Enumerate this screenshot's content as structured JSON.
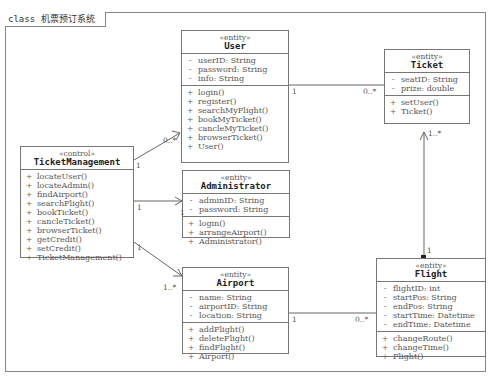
{
  "frame": {
    "label": "class 机票预订系统"
  },
  "classes": {
    "user": {
      "stereotype": "«entity»",
      "name": "User",
      "attributes": [
        {
          "vis": "-",
          "text": "userID: String"
        },
        {
          "vis": "-",
          "text": "password: String"
        },
        {
          "vis": "-",
          "text": "info: String"
        }
      ],
      "operations": [
        {
          "vis": "+",
          "text": "login()"
        },
        {
          "vis": "+",
          "text": "register()"
        },
        {
          "vis": "+",
          "text": "searchMyFlight()"
        },
        {
          "vis": "+",
          "text": "bookMyTicket()"
        },
        {
          "vis": "+",
          "text": "cancleMyTicket()"
        },
        {
          "vis": "+",
          "text": "browserTicket()"
        },
        {
          "vis": "+",
          "text": "User()"
        }
      ]
    },
    "ticket": {
      "stereotype": "«entity»",
      "name": "Ticket",
      "attributes": [
        {
          "vis": "-",
          "text": "seatID: String"
        },
        {
          "vis": "-",
          "text": "prize: double"
        }
      ],
      "operations": [
        {
          "vis": "+",
          "text": "setUser()"
        },
        {
          "vis": "+",
          "text": "Ticket()"
        }
      ]
    },
    "ticketmanagement": {
      "stereotype": "«control»",
      "name": "TicketManagement",
      "attributes": [],
      "operations": [
        {
          "vis": "+",
          "text": "locateUser()"
        },
        {
          "vis": "+",
          "text": "locateAdmin()"
        },
        {
          "vis": "+",
          "text": "findAirport()"
        },
        {
          "vis": "+",
          "text": "searchFlight()"
        },
        {
          "vis": "+",
          "text": "bookTicket()"
        },
        {
          "vis": "+",
          "text": "cancleTicket()"
        },
        {
          "vis": "+",
          "text": "browserTicket()"
        },
        {
          "vis": "+",
          "text": "getCredit()"
        },
        {
          "vis": "+",
          "text": "setCredit()"
        },
        {
          "vis": "+",
          "text": "TicketManagement()"
        }
      ]
    },
    "administrator": {
      "stereotype": "«entity»",
      "name": "Administrator",
      "attributes": [
        {
          "vis": "-",
          "text": "adminID: String"
        },
        {
          "vis": "-",
          "text": "password: String"
        }
      ],
      "operations": [
        {
          "vis": "+",
          "text": "login()"
        },
        {
          "vis": "+",
          "text": "arrangeAirport()"
        },
        {
          "vis": "+",
          "text": "Administrator()"
        }
      ]
    },
    "airport": {
      "stereotype": "«entity»",
      "name": "Airport",
      "attributes": [
        {
          "vis": "-",
          "text": "name: String"
        },
        {
          "vis": "-",
          "text": "airportID: String"
        },
        {
          "vis": "-",
          "text": "location: String"
        }
      ],
      "operations": [
        {
          "vis": "+",
          "text": "addFlight()"
        },
        {
          "vis": "+",
          "text": "deleteFlight()"
        },
        {
          "vis": "+",
          "text": "findFlight()"
        },
        {
          "vis": "+",
          "text": "Airport()"
        }
      ]
    },
    "flight": {
      "stereotype": "«entity»",
      "name": "Flight",
      "attributes": [
        {
          "vis": "-",
          "text": "flightID: int"
        },
        {
          "vis": "-",
          "text": "startPos: String"
        },
        {
          "vis": "-",
          "text": "endPos: String"
        },
        {
          "vis": "-",
          "text": "startTime: Datetime"
        },
        {
          "vis": "-",
          "text": "endTime: Datetime"
        }
      ],
      "operations": [
        {
          "vis": "+",
          "text": "changeRoute()"
        },
        {
          "vis": "+",
          "text": "changeTime()"
        },
        {
          "vis": "+",
          "text": "Flight()"
        }
      ]
    }
  },
  "multiplicities": {
    "tm_user_src": "1",
    "tm_user_dst": "0..*",
    "user_ticket_src": "1",
    "user_ticket_dst": "0..*",
    "tm_admin_src": "1",
    "tm_admin_dst": "1",
    "tm_airport_src": "1",
    "tm_airport_dst": "1..*",
    "airport_flight_src": "1",
    "airport_flight_dst": "0..*",
    "flight_ticket_src": "1",
    "flight_ticket_dst": "1..*"
  }
}
